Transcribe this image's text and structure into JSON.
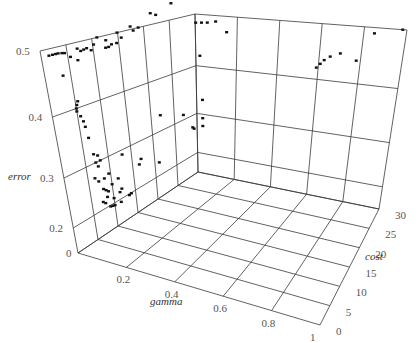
{
  "chart_data": {
    "type": "scatter3d",
    "title": "",
    "xlabel": "gamma",
    "ylabel": "cost",
    "zlabel": "error",
    "xlim": [
      0,
      1
    ],
    "ylim": [
      0,
      30
    ],
    "zlim": [
      0,
      0.5
    ],
    "grid": true,
    "legend": null,
    "x_ticks": [
      "0.2",
      "0.4",
      "0.6",
      "0.8",
      "1"
    ],
    "y_ticks": [
      "0",
      "5",
      "10",
      "15",
      "20",
      "25",
      "30"
    ],
    "z_ticks": [
      "0",
      "0.2",
      "0.3",
      "0.4",
      "0.5"
    ],
    "series": [
      {
        "name": "points",
        "points_gamma_cost_error": [
          [
            0,
            1.5,
            0.49
          ],
          [
            0,
            2.2,
            0.49
          ],
          [
            0,
            2.8,
            0.49
          ],
          [
            0,
            3.3,
            0.49
          ],
          [
            0,
            4,
            0.489
          ],
          [
            0,
            4.5,
            0.488
          ],
          [
            0,
            5.5,
            0.48
          ],
          [
            0,
            7,
            0.49
          ],
          [
            0,
            7.6,
            0.485
          ],
          [
            0,
            8.2,
            0.486
          ],
          [
            0,
            8.8,
            0.487
          ],
          [
            0,
            9.6,
            0.482
          ],
          [
            0,
            6.8,
            0.472
          ],
          [
            0,
            10.2,
            0.49
          ],
          [
            0,
            11,
            0.5
          ],
          [
            0,
            12.4,
            0.48
          ],
          [
            0,
            13,
            0.48
          ],
          [
            0,
            13.6,
            0.483
          ],
          [
            0,
            12.6,
            0.492
          ],
          [
            0,
            14.6,
            0.483
          ],
          [
            0,
            14.9,
            0.5
          ],
          [
            0,
            15.6,
            0.49
          ],
          [
            0,
            17.5,
            0.505
          ],
          [
            0,
            18,
            0.497
          ],
          [
            0,
            19,
            0.5
          ],
          [
            0,
            21.5,
            0.52
          ],
          [
            0,
            22.5,
            0.515
          ],
          [
            0,
            25.5,
            0.53
          ],
          [
            0,
            3.5,
            0.455
          ],
          [
            0,
            5,
            0.4
          ],
          [
            0,
            5.2,
            0.405
          ],
          [
            0,
            5.5,
            0.41
          ],
          [
            0,
            5,
            0.395
          ],
          [
            0,
            5.6,
            0.385
          ],
          [
            0,
            6,
            0.375
          ],
          [
            0,
            6.2,
            0.365
          ],
          [
            0,
            6.5,
            0.345
          ],
          [
            0,
            7,
            0.315
          ],
          [
            0,
            7.8,
            0.31
          ],
          [
            0,
            7.2,
            0.3
          ],
          [
            0,
            7.6,
            0.29
          ],
          [
            0,
            8.2,
            0.3
          ],
          [
            0,
            6.5,
            0.27
          ],
          [
            0,
            7.2,
            0.26
          ],
          [
            0,
            8.5,
            0.26
          ],
          [
            0,
            9.6,
            0.265
          ],
          [
            0,
            13,
            0.29
          ],
          [
            0,
            8,
            0.24
          ],
          [
            0,
            8.5,
            0.235
          ],
          [
            0,
            9,
            0.23
          ],
          [
            0,
            10,
            0.24
          ],
          [
            0,
            11.5,
            0.245
          ],
          [
            0,
            7.5,
            0.215
          ],
          [
            0,
            8,
            0.21
          ],
          [
            0,
            8.6,
            0.22
          ],
          [
            0,
            10,
            0.21
          ],
          [
            0,
            11.5,
            0.215
          ],
          [
            0,
            12,
            0.22
          ],
          [
            0,
            9,
            0.19
          ],
          [
            0,
            9.5,
            0.185
          ],
          [
            0,
            10,
            0.18
          ],
          [
            0,
            11.5,
            0.175
          ],
          [
            0,
            13.5,
            0.19
          ],
          [
            0,
            14,
            0.195
          ],
          [
            0,
            16.5,
            0.25
          ],
          [
            0,
            17,
            0.26
          ],
          [
            0,
            21,
            0.23
          ],
          [
            0,
            22,
            0.33
          ],
          [
            0,
            27,
            0.31
          ],
          [
            0,
            29,
            0.27
          ],
          [
            0,
            29.3,
            0.265
          ],
          [
            0.05,
            28,
            0.49
          ],
          [
            0.07,
            28.3,
            0.49
          ],
          [
            0.09,
            28.6,
            0.49
          ],
          [
            0.12,
            29,
            0.492
          ],
          [
            0.02,
            30,
            0.42
          ],
          [
            0.03,
            30,
            0.33
          ],
          [
            0.03,
            30,
            0.29
          ],
          [
            0.03,
            30,
            0.27
          ],
          [
            0.1,
            30,
            0.56
          ],
          [
            0.25,
            30,
            0.56
          ],
          [
            0.45,
            30,
            0.55
          ],
          [
            0.75,
            30,
            0.55
          ],
          [
            0.98,
            30,
            0.5
          ],
          [
            0.15,
            30,
            0.47
          ],
          [
            0.85,
            30,
            0.49
          ],
          [
            0.78,
            30,
            0.44
          ],
          [
            0.62,
            28,
            0.43
          ],
          [
            0.63,
            28.5,
            0.435
          ],
          [
            0.64,
            29,
            0.44
          ],
          [
            0.66,
            29.5,
            0.445
          ],
          [
            0.7,
            30,
            0.45
          ]
        ]
      }
    ]
  },
  "labels": {
    "z_axis": "error",
    "x_axis": "gamma",
    "y_axis": "cost"
  }
}
